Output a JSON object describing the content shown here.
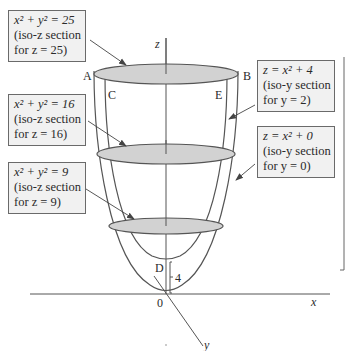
{
  "diagram": {
    "axes": {
      "x": "x",
      "y": "y",
      "z": "z",
      "origin": "0"
    },
    "points": {
      "A": "A",
      "B": "B",
      "C": "C",
      "D": "D",
      "E": "E"
    },
    "offset_label": "4",
    "callouts": [
      {
        "id": "iso-z-25",
        "line1": "x² + y² = 25",
        "line2": "(iso-z section",
        "line3": "for z = 25)"
      },
      {
        "id": "iso-z-16",
        "line1": "x² + y² = 16",
        "line2": "(iso-z section",
        "line3": "for z = 16)"
      },
      {
        "id": "iso-z-9",
        "line1": "x² + y² = 9",
        "line2": "(iso-z section",
        "line3": "for z = 9)"
      },
      {
        "id": "iso-y-2",
        "line1": "z = x² + 4",
        "line2": "(iso-y section",
        "line3": "for y = 2)"
      },
      {
        "id": "iso-y-0",
        "line1": "z = x² + 0",
        "line2": "(iso-y section",
        "line3": "for y = 0)"
      }
    ],
    "colors": {
      "section_fill": "#d2d2d2",
      "line": "#555555",
      "box_fill": "#f1f1f1"
    }
  }
}
